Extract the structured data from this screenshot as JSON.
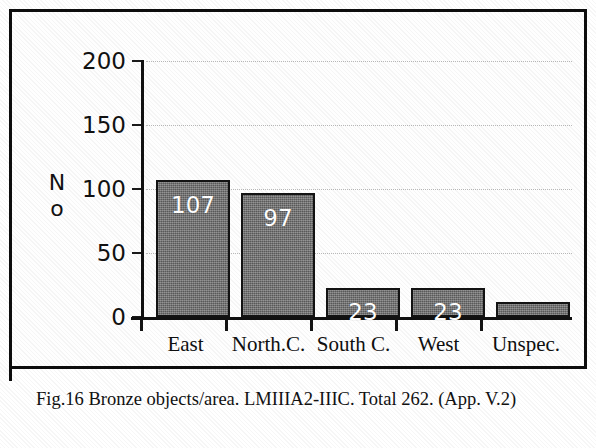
{
  "figure": {
    "caption": "Fig.16  Bronze objects/area. LMIIIA2-IIIC. Total 262. (App. V.2)",
    "frame_color": "#0d0d0d"
  },
  "chart_data": {
    "type": "bar",
    "title": "",
    "xlabel": "",
    "ylabel": "No",
    "categories": [
      "East",
      "North.C.",
      "South C.",
      "West",
      "Unspec."
    ],
    "values": [
      107,
      97,
      23,
      23,
      12
    ],
    "bar_labels": [
      "107",
      "97",
      "23",
      "23",
      ""
    ],
    "ylim": [
      0,
      200
    ],
    "yticks": [
      0,
      50,
      100,
      150,
      200
    ],
    "ytick_labels": [
      "0",
      "50",
      "100",
      "150",
      "200"
    ],
    "grid": true,
    "grid_axis": "y",
    "legend": false,
    "total": 262,
    "bar_color": "#6e6e6e",
    "bar_edge_color": "#131313",
    "value_label_color": "#ffffff",
    "gridline_color": "#b9b9b9",
    "axis_color": "#111111"
  }
}
